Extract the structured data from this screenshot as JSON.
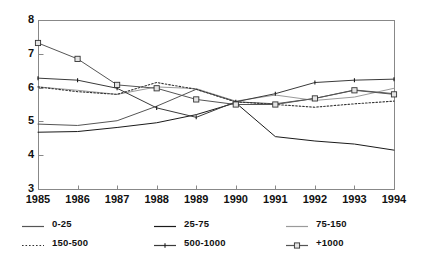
{
  "chart_data": {
    "type": "line",
    "title": "",
    "xlabel": "",
    "ylabel": "",
    "x": [
      1985,
      1986,
      1987,
      1988,
      1989,
      1990,
      1991,
      1992,
      1993,
      1994
    ],
    "categories": [
      "1985",
      "1986",
      "1987",
      "1988",
      "1989",
      "1990",
      "1991",
      "1992",
      "1993",
      "1994"
    ],
    "xlim": [
      1985,
      1994
    ],
    "ylim": [
      3,
      8
    ],
    "yticks": [
      3,
      4,
      5,
      6,
      7,
      8
    ],
    "ytick_labels": [
      "3",
      "4",
      "5",
      "6",
      "7",
      "8"
    ],
    "grid": false,
    "legend_position": "below",
    "series": [
      {
        "name": "0-25",
        "color": "#555555",
        "style": "solid",
        "marker": "none",
        "values": [
          4.92,
          4.88,
          5.02,
          5.45,
          5.95,
          5.58,
          5.52,
          5.68,
          5.93,
          5.82
        ]
      },
      {
        "name": "25-75",
        "color": "#1a1a1a",
        "style": "solid",
        "marker": "none",
        "values": [
          4.68,
          4.7,
          4.82,
          4.96,
          5.2,
          5.55,
          4.55,
          4.42,
          4.33,
          4.15
        ]
      },
      {
        "name": "75-150",
        "color": "#9a9a9a",
        "style": "solid",
        "marker": "none",
        "values": [
          6.02,
          5.92,
          5.8,
          6.02,
          5.97,
          5.6,
          5.78,
          5.62,
          5.72,
          5.98
        ]
      },
      {
        "name": "150-500",
        "color": "#333333",
        "style": "dotted",
        "marker": "none",
        "values": [
          6.02,
          5.88,
          5.8,
          6.15,
          5.95,
          5.58,
          5.5,
          5.42,
          5.52,
          5.6
        ]
      },
      {
        "name": "500-1000",
        "color": "#3a3a3a",
        "style": "solid",
        "marker": "tick",
        "values": [
          6.28,
          6.22,
          5.98,
          5.4,
          5.12,
          5.58,
          5.82,
          6.15,
          6.22,
          6.25
        ]
      },
      {
        "name": "+1000",
        "color": "#555555",
        "style": "solid",
        "marker": "square",
        "values": [
          7.32,
          6.85,
          6.08,
          5.98,
          5.65,
          5.5,
          5.5,
          5.68,
          5.92,
          5.8
        ]
      }
    ]
  },
  "axes": {
    "frame_color": "#888888"
  },
  "legend": {
    "items": [
      {
        "label": "0-25",
        "key": "0"
      },
      {
        "label": "25-75",
        "key": "1"
      },
      {
        "label": "75-150",
        "key": "2"
      },
      {
        "label": "150-500",
        "key": "3"
      },
      {
        "label": "500-1000",
        "key": "4"
      },
      {
        "label": "+1000",
        "key": "5"
      }
    ]
  }
}
